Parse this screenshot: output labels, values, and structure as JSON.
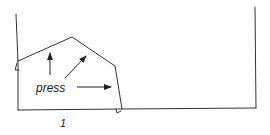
{
  "diagram": {
    "labels": {
      "press": "press",
      "number": "1"
    },
    "colors": {
      "stroke": "#333333",
      "background": "#ffffff"
    },
    "shapes": {
      "left_wall": "container-left-wall",
      "right_wall": "container-right-wall",
      "floor": "container-floor",
      "deformed_body": "pentagonal-body",
      "arrows": [
        "arrow-up",
        "arrow-diagonal-up-right",
        "arrow-right"
      ]
    }
  }
}
